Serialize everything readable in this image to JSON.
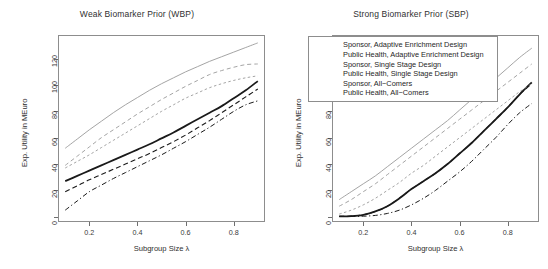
{
  "figure": {
    "width": 548,
    "height": 269,
    "background": "#ffffff"
  },
  "axis": {
    "xlabel": "Subgroup Size λ",
    "ylabel": "Exp. Utility in MEuro",
    "xticks": [
      "0.2",
      "0.4",
      "0.6",
      "0.8"
    ],
    "xtick_values": [
      0.2,
      0.4,
      0.6,
      0.8
    ],
    "yticks": [
      "0",
      "20",
      "40",
      "60",
      "80",
      "100",
      "120"
    ],
    "ytick_values": [
      0,
      20,
      40,
      60,
      80,
      100,
      120
    ]
  },
  "legend": {
    "position": "top-left of right panel",
    "entries": [
      {
        "label": "Sponsor, Adaptive Enrichment Design",
        "color": "#9a9a9a",
        "width": 0.9,
        "dash": "none"
      },
      {
        "label": "Public Health, Adaptive Enrichment Design",
        "color": "#1a1a1a",
        "width": 1.8,
        "dash": "none"
      },
      {
        "label": "Sponsor, Single Stage Design",
        "color": "#9a9a9a",
        "width": 0.9,
        "dash": "4,3"
      },
      {
        "label": "Public Health, Single Stage Design",
        "color": "#1a1a1a",
        "width": 1.1,
        "dash": "5,3"
      },
      {
        "label": "Sponsor, All−Comers",
        "color": "#9a9a9a",
        "width": 0.9,
        "dash": "2.5,2.5"
      },
      {
        "label": "Public Health, All−Comers",
        "color": "#1a1a1a",
        "width": 1.0,
        "dash": "5,2.5,1.2,2.5"
      }
    ]
  },
  "chart_data": [
    {
      "type": "line",
      "title": "Weak Biomarker Prior (WBP)",
      "xlabel": "Subgroup Size λ",
      "ylabel": "Exp. Utility in MEuro",
      "xlim": [
        0.07,
        0.93
      ],
      "ylim": [
        -4,
        138
      ],
      "grid": false,
      "legend_position": "none",
      "x": [
        0.1,
        0.15,
        0.2,
        0.25,
        0.3,
        0.35,
        0.4,
        0.45,
        0.5,
        0.55,
        0.6,
        0.65,
        0.7,
        0.75,
        0.8,
        0.85,
        0.9
      ],
      "series": [
        {
          "name": "Sponsor, Adaptive Enrichment Design",
          "color": "#9a9a9a",
          "width": 0.9,
          "dash": "none",
          "values": [
            52,
            59,
            66,
            72.5,
            79,
            85,
            90.5,
            96,
            101,
            105.5,
            110,
            114,
            118,
            121.5,
            125,
            128.5,
            132
          ]
        },
        {
          "name": "Public Health, Adaptive Enrichment Design",
          "color": "#1a1a1a",
          "width": 1.8,
          "dash": "none",
          "values": [
            27,
            31,
            35,
            39,
            43,
            47,
            51,
            55,
            59.5,
            64,
            69,
            74,
            79,
            84,
            90,
            96,
            103
          ]
        },
        {
          "name": "Sponsor, Single Stage Design",
          "color": "#9a9a9a",
          "width": 0.9,
          "dash": "4,3",
          "values": [
            39,
            46,
            53,
            60,
            66,
            72,
            78,
            83.5,
            89,
            94,
            99,
            103.5,
            108,
            111,
            113.5,
            115.5,
            116
          ]
        },
        {
          "name": "Public Health, Single Stage Design",
          "color": "#1a1a1a",
          "width": 1.1,
          "dash": "5,3",
          "values": [
            19,
            23.5,
            28,
            32,
            36,
            40,
            44,
            48,
            52.5,
            57,
            62,
            67.5,
            73,
            79,
            85,
            91,
            97
          ]
        },
        {
          "name": "Sponsor, All−Comers",
          "color": "#9a9a9a",
          "width": 0.9,
          "dash": "2.5,2.5",
          "values": [
            37,
            42,
            47,
            52.5,
            58,
            63.5,
            69,
            74.5,
            80,
            85,
            90,
            94,
            98,
            101,
            103.5,
            105.5,
            107
          ]
        },
        {
          "name": "Public Health, All−Comers",
          "color": "#1a1a1a",
          "width": 1.0,
          "dash": "5,2.5,1.2,2.5",
          "values": [
            5,
            12,
            19,
            24,
            29,
            33.5,
            38,
            42.5,
            47,
            52,
            57,
            62.5,
            68,
            74,
            80,
            85,
            88
          ]
        }
      ]
    },
    {
      "type": "line",
      "title": "Strong Biomarker Prior (SBP)",
      "xlabel": "Subgroup Size λ",
      "ylabel": "Exp. Utility in MEuro",
      "xlim": [
        0.07,
        0.93
      ],
      "ylim": [
        -4,
        138
      ],
      "grid": false,
      "legend_position": "top-left",
      "x": [
        0.1,
        0.15,
        0.2,
        0.25,
        0.3,
        0.35,
        0.4,
        0.45,
        0.5,
        0.55,
        0.6,
        0.65,
        0.7,
        0.75,
        0.8,
        0.85,
        0.9
      ],
      "series": [
        {
          "name": "Sponsor, Adaptive Enrichment Design",
          "color": "#9a9a9a",
          "width": 0.9,
          "dash": "none",
          "values": [
            13,
            19,
            25,
            31,
            38,
            45,
            52,
            59,
            66,
            73,
            81,
            89,
            97,
            105,
            113,
            121,
            128
          ]
        },
        {
          "name": "Public Health, Adaptive Enrichment Design",
          "color": "#1a1a1a",
          "width": 1.8,
          "dash": "none",
          "values": [
            0.3,
            0.5,
            1.5,
            4,
            8,
            14,
            21,
            27,
            33,
            40,
            48,
            56,
            65,
            74,
            83,
            93,
            102
          ]
        },
        {
          "name": "Sponsor, Single Stage Design",
          "color": "#9a9a9a",
          "width": 0.9,
          "dash": "4,3",
          "values": [
            8,
            13,
            19,
            25,
            32,
            39,
            46,
            53,
            60,
            67,
            74,
            81,
            88,
            95,
            102,
            109,
            116
          ]
        },
        {
          "name": "Public Health, Single Stage Design",
          "color": "#1a1a1a",
          "width": 1.1,
          "dash": "5,3",
          "values": [
            0.3,
            0.5,
            1.5,
            4,
            8,
            14,
            21,
            27,
            33,
            40,
            48,
            56,
            65,
            74,
            83,
            93,
            101
          ]
        },
        {
          "name": "Sponsor, All−Comers",
          "color": "#9a9a9a",
          "width": 0.9,
          "dash": "2.5,2.5",
          "values": [
            2,
            5,
            9,
            14,
            20,
            26,
            33,
            39,
            46,
            53,
            60,
            67,
            74,
            81,
            88,
            95,
            101
          ]
        },
        {
          "name": "Public Health, All−Comers",
          "color": "#1a1a1a",
          "width": 1.0,
          "dash": "5,2.5,1.2,2.5",
          "values": [
            0.2,
            0.2,
            0.4,
            1,
            2.5,
            5,
            9,
            14,
            20,
            27,
            34,
            42,
            51,
            60,
            70,
            79,
            86
          ]
        }
      ]
    }
  ]
}
